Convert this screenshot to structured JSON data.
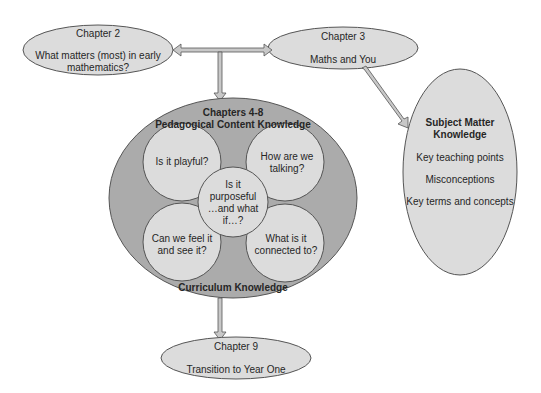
{
  "diagram": {
    "nodes": {
      "chapter2": {
        "title": "Chapter 2",
        "subtitle": "What matters (most) in early mathematics?"
      },
      "chapter3": {
        "title": "Chapter 3",
        "subtitle": "Maths and You"
      },
      "pck": {
        "title": "Chapters 4-8",
        "subtitle": "Pedagogical Content Knowledge",
        "footer": "Curriculum Knowledge",
        "circles": {
          "playful": "Is it playful?",
          "talking": "How are we talking?",
          "purposeful": "Is it purposeful …and what if…?",
          "feel": "Can we feel it and see it?",
          "connected": "What is it connected to?"
        }
      },
      "smk": {
        "title": "Subject Matter Knowledge",
        "items": [
          "Key teaching points",
          "Misconceptions",
          "Key terms and concepts"
        ]
      },
      "chapter9": {
        "title": "Chapter 9",
        "subtitle": "Transition to Year One"
      }
    },
    "colors": {
      "light_fill": "#dcdcdc",
      "dark_fill": "#aaaaaa",
      "stroke": "#555555",
      "arrow_fill": "#c8c8c8"
    }
  }
}
